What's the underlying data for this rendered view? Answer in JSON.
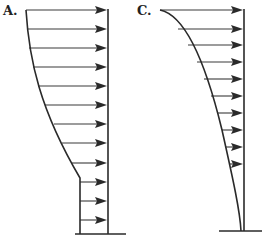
{
  "figure": {
    "panels": [
      {
        "id": "A",
        "label": "A.",
        "description": "Velocity profile with curved upper region and constant lower region",
        "wall_x": 108,
        "top_y": 10,
        "ground_y": 234,
        "ground": {
          "x1": 75,
          "x2": 126
        },
        "profile_path": "M26,10 C29,60 40,110 80,178 L80,234",
        "arrows": [
          {
            "y": 10,
            "x_start": 26
          },
          {
            "y": 29,
            "x_start": 27
          },
          {
            "y": 48,
            "x_start": 29
          },
          {
            "y": 67,
            "x_start": 33
          },
          {
            "y": 86,
            "x_start": 38
          },
          {
            "y": 105,
            "x_start": 45
          },
          {
            "y": 124,
            "x_start": 54
          },
          {
            "y": 143,
            "x_start": 62
          },
          {
            "y": 163,
            "x_start": 72
          },
          {
            "y": 182,
            "x_start": 80
          },
          {
            "y": 201,
            "x_start": 80
          },
          {
            "y": 220,
            "x_start": 80
          }
        ]
      },
      {
        "id": "C",
        "label": "C.",
        "description": "Velocity profile with smooth curve tapering to zero at base",
        "wall_x": 244,
        "top_y": 10,
        "ground_y": 231,
        "ground": {
          "x1": 219,
          "x2": 262
        },
        "profile_path": "M160,10 C185,15 205,60 222,130 C232,175 240,210 241,231",
        "arrows": [
          {
            "y": 10,
            "x_start": 160
          },
          {
            "y": 29,
            "x_start": 178
          },
          {
            "y": 45,
            "x_start": 188
          },
          {
            "y": 62,
            "x_start": 197
          },
          {
            "y": 79,
            "x_start": 204
          },
          {
            "y": 96,
            "x_start": 211
          },
          {
            "y": 113,
            "x_start": 217
          },
          {
            "y": 130,
            "x_start": 222
          },
          {
            "y": 147,
            "x_start": 226
          },
          {
            "y": 164,
            "x_start": 230
          }
        ]
      }
    ],
    "colors": {
      "ink": "#2a2a2a",
      "background": "#ffffff"
    }
  }
}
